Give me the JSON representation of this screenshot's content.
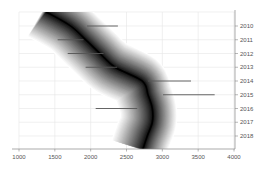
{
  "chart_data": {
    "type": "area",
    "title": "",
    "xlabel": "",
    "ylabel": "",
    "orientation": "horizontal-bands-with-error-bars",
    "xlim": [
      1000,
      4000
    ],
    "x_ticks": [
      1000,
      1500,
      2000,
      2500,
      3000,
      3500,
      4000
    ],
    "y_axis_position": "right",
    "y_categories": [
      "2010",
      "2011",
      "2012",
      "2013",
      "2014",
      "2015",
      "2016",
      "2017",
      "2018"
    ],
    "grid": true,
    "legend": null,
    "band": {
      "description": "Grayscale density band (fan) curving from upper-left to lower-right then bending back",
      "center": [
        {
          "year": "top",
          "x": 1380
        },
        {
          "year": "2010",
          "x": 1720
        },
        {
          "year": "2011",
          "x": 1930
        },
        {
          "year": "2012",
          "x": 2130
        },
        {
          "year": "2013",
          "x": 2340
        },
        {
          "year": "2014",
          "x": 2720
        },
        {
          "year": "2015",
          "x": 2800
        },
        {
          "year": "2016",
          "x": 2860
        },
        {
          "year": "2017",
          "x": 2860
        },
        {
          "year": "2018",
          "x": 2790
        },
        {
          "year": "bottom",
          "x": 2730
        }
      ],
      "half_width": 400
    },
    "series": [
      {
        "name": "ranges",
        "values": [
          {
            "year": "2010",
            "start": 1950,
            "end": 2380
          },
          {
            "year": "2011",
            "start": 1540,
            "end": 1900
          },
          {
            "year": "2012",
            "start": 1680,
            "end": 2180
          },
          {
            "year": "2013",
            "start": 1930,
            "end": 2370
          },
          {
            "year": "2014",
            "start": 2800,
            "end": 3400
          },
          {
            "year": "2015",
            "start": 3010,
            "end": 3730
          },
          {
            "year": "2016",
            "start": 2070,
            "end": 2650
          }
        ]
      }
    ]
  },
  "axes": {
    "x_labels": [
      "1000",
      "1500",
      "2000",
      "2500",
      "3000",
      "3500",
      "4000"
    ],
    "y_labels": [
      "2010",
      "2011",
      "2012",
      "2013",
      "2014",
      "2015",
      "2016",
      "2017",
      "2018"
    ]
  },
  "colors": {
    "band_core": "#000000",
    "band_edge": "#ffffff",
    "bar": "#555555",
    "grid": "#e6e6e6",
    "axis": "#888888",
    "label": "#555555"
  }
}
